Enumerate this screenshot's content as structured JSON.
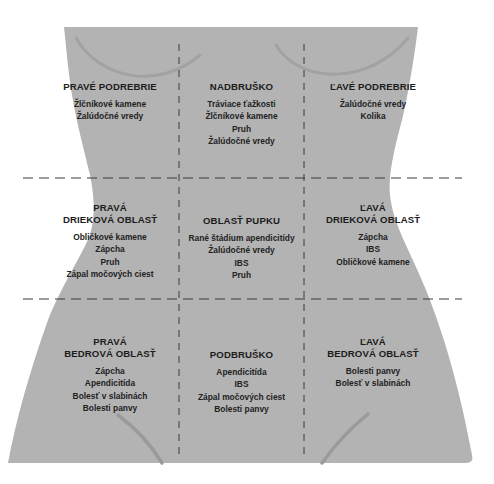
{
  "diagram": {
    "colors": {
      "background": "#ffffff",
      "torso_fill": "#b3b3b3",
      "contour_line": "#9d9d9d",
      "divider": "#3a3a3a",
      "text": "#1e1e1e"
    },
    "regions": [
      {
        "id": "right-hypochondriac",
        "title": "PRAVÉ PODREBRIE",
        "items": [
          "Žlčníkové kamene",
          "Žalúdočné vredy"
        ]
      },
      {
        "id": "epigastric",
        "title": "NADBRUŠKO",
        "items": [
          "Tráviace ťažkosti",
          "Žlčníkové kamene",
          "Pruh",
          "Žalúdočné vredy"
        ]
      },
      {
        "id": "left-hypochondriac",
        "title": "ĽAVÉ PODREBRIE",
        "items": [
          "Žalúdočné vredy",
          "Kolika"
        ]
      },
      {
        "id": "right-lumbar",
        "title": "PRAVÁ\nDRIEKOVÁ OBLASŤ",
        "items": [
          "Obličkové kamene",
          "Zápcha",
          "Pruh",
          "Zápal močových ciest"
        ]
      },
      {
        "id": "umbilical",
        "title": "OBLASŤ PUPKU",
        "items": [
          "Rané štádium apendicitídy",
          "Žalúdočné vredy",
          "IBS",
          "Pruh"
        ]
      },
      {
        "id": "left-lumbar",
        "title": "ĽAVÁ\nDRIEKOVÁ OBLASŤ",
        "items": [
          "Zápcha",
          "IBS",
          "Obličkové kamene"
        ]
      },
      {
        "id": "right-iliac",
        "title": "PRAVÁ\nBEDROVÁ OBLASŤ",
        "items": [
          "Zápcha",
          "Apendicitída",
          "Bolesť v slabinách",
          "Bolesti panvy"
        ]
      },
      {
        "id": "hypogastric",
        "title": "PODBRUŠKO",
        "items": [
          "Apendicitída",
          "IBS",
          "Zápal močových ciest",
          "Bolesti panvy"
        ]
      },
      {
        "id": "left-iliac",
        "title": "ĽAVÁ\nBEDROVÁ OBLASŤ",
        "items": [
          "Bolesti panvy",
          "Bolesť v slabinách"
        ]
      }
    ]
  }
}
